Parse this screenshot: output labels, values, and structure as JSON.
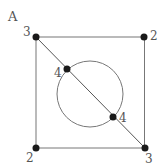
{
  "figure": {
    "label": "A",
    "vertices": [
      {
        "id": "top-left",
        "degree": "3",
        "x": 36,
        "y": 37
      },
      {
        "id": "top-right",
        "degree": "2",
        "x": 144,
        "y": 37
      },
      {
        "id": "bottom-left",
        "degree": "2",
        "x": 36,
        "y": 148
      },
      {
        "id": "bottom-right",
        "degree": "3",
        "x": 145,
        "y": 148
      },
      {
        "id": "circle-upper",
        "degree": "4",
        "x": 67,
        "y": 69
      },
      {
        "id": "circle-lower",
        "degree": "4",
        "x": 113,
        "y": 117
      }
    ],
    "colors": {
      "line": "#666666",
      "dot": "#1a1a1a",
      "text": "#555555"
    }
  }
}
